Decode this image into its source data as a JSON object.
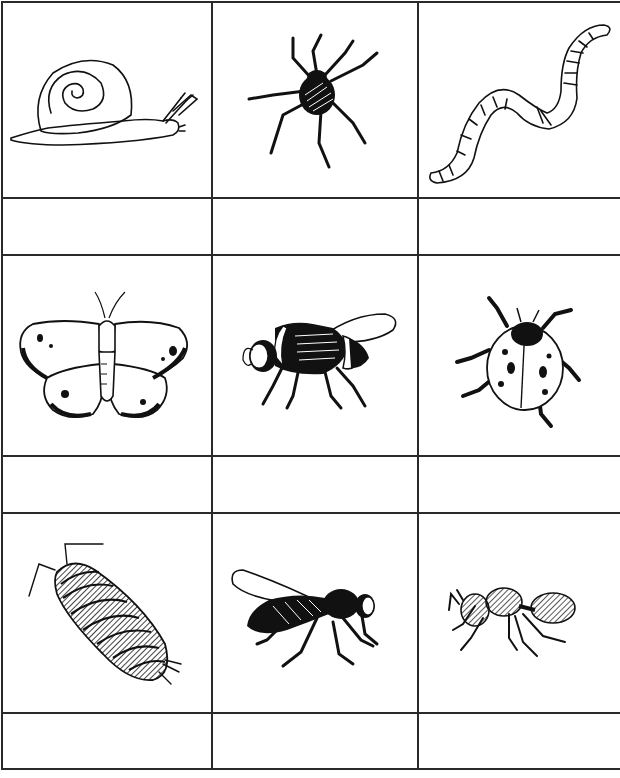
{
  "worksheet": {
    "rows": [
      {
        "items": [
          {
            "name": "snail",
            "label": ""
          },
          {
            "name": "spider",
            "label": ""
          },
          {
            "name": "worm",
            "label": ""
          }
        ]
      },
      {
        "items": [
          {
            "name": "butterfly",
            "label": ""
          },
          {
            "name": "bumblebee",
            "label": ""
          },
          {
            "name": "ladybird",
            "label": ""
          }
        ]
      },
      {
        "items": [
          {
            "name": "woodlouse",
            "label": ""
          },
          {
            "name": "wasp",
            "label": ""
          },
          {
            "name": "ant",
            "label": ""
          }
        ]
      }
    ]
  },
  "colors": {
    "ink": "#111111",
    "grid": "#2a2a2a",
    "paper": "#ffffff"
  }
}
